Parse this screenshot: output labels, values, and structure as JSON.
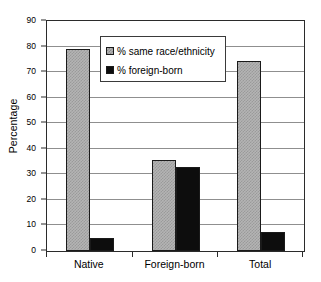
{
  "chart_data": {
    "type": "bar",
    "title": "",
    "xlabel": "",
    "ylabel": "Percentage",
    "categories": [
      "Native",
      "Foreign-born",
      "Total"
    ],
    "series": [
      {
        "name": "% same race/ethnicity",
        "values": [
          79,
          35.5,
          74.5
        ],
        "color": "#b4b4b4"
      },
      {
        "name": "% foreign-born",
        "values": [
          5,
          33,
          7.5
        ],
        "color": "#0d0d0d"
      }
    ],
    "ylim": [
      0,
      90
    ],
    "ytick_step": 10,
    "yticks": [
      0,
      10,
      20,
      30,
      40,
      50,
      60,
      70,
      80,
      90
    ],
    "ytick_labels": [
      "0",
      "10",
      "20",
      "30",
      "40",
      "50",
      "60",
      "70",
      "80",
      "90"
    ],
    "grid": true,
    "grid_axis": "y",
    "legend_position": "upper center",
    "plot_border": true
  }
}
